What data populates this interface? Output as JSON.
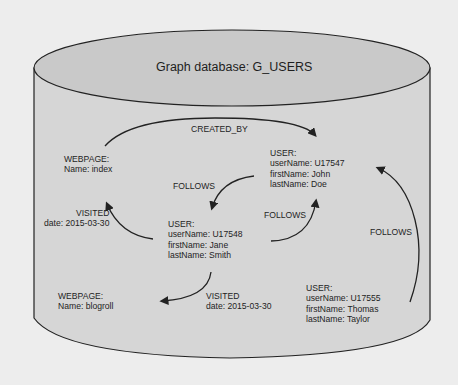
{
  "title": "Graph database: G_USERS",
  "colors": {
    "cylinder_body": "#d6d6d6",
    "cylinder_top": "#c9c9c9",
    "stroke": "#222222",
    "background": "#ededed"
  },
  "nodes": {
    "webpage_index": {
      "type": "WEBPAGE:",
      "line1": "Name: index"
    },
    "user_john": {
      "type": "USER:",
      "line1": "userName: U17547",
      "line2": "firstName: John",
      "line3": "lastName: Doe"
    },
    "user_jane": {
      "type": "USER:",
      "line1": "userName: U17548",
      "line2": "firstName: Jane",
      "line3": "lastName: Smith"
    },
    "webpage_blogroll": {
      "type": "WEBPAGE:",
      "line1": "Name: blogroll"
    },
    "user_thomas": {
      "type": "USER:",
      "line1": "userName: U17555",
      "line2": "firstName: Thomas",
      "line3": "lastName: Taylor"
    }
  },
  "edges": {
    "created_by": {
      "label": "CREATED_BY"
    },
    "john_follows_jane": {
      "label": "FOLLOWS"
    },
    "jane_follows_john": {
      "label": "FOLLOWS"
    },
    "thomas_follows_john": {
      "label": "FOLLOWS"
    },
    "jane_visited_index": {
      "label": "VISITED",
      "date": "date: 2015-03-30"
    },
    "jane_visited_blogroll": {
      "label": "VISITED",
      "date": "date: 2015-03-30"
    }
  }
}
